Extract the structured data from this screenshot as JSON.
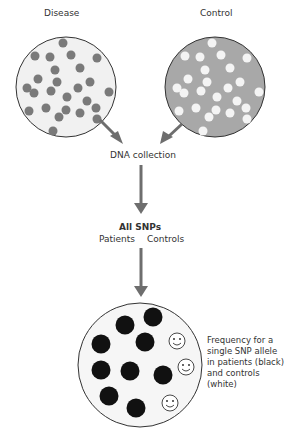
{
  "diagram": {
    "disease_label": "Disease",
    "control_label": "Control",
    "dna_collection_label": "DNA collection",
    "all_snps_label": "All SNPs",
    "patients_label": "Patients",
    "controls_label": "Controls",
    "frequency_caption_lines": [
      "Frequency for a",
      "single SNP allele",
      "in patients (black)",
      "and controls",
      "(white)"
    ],
    "colors": {
      "disease_fill": "#f1f1f1",
      "disease_dot": "#7a7a7a",
      "control_fill": "#a8a8a8",
      "control_dot": "#f4f4f4",
      "arrow": "#6e6e6e",
      "patient_dot": "#111111",
      "outline": "#333333"
    },
    "result_counts": {
      "patients_black": 10,
      "controls_white": 3
    }
  }
}
